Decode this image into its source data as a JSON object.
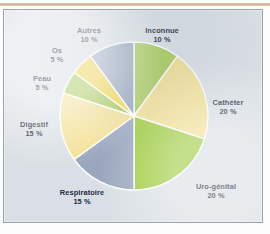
{
  "figure": {
    "background_color": "#d9dfe4",
    "frame_border_color": "#9aa3ab",
    "top_rule_color": "#efa898",
    "label_color": "#1d2a3d"
  },
  "chart_data": {
    "type": "pie",
    "title": "",
    "subtitle": "",
    "xlabel": "",
    "ylabel": "",
    "legend_position": "none",
    "grid": false,
    "start_angle_deg": 0,
    "direction": "clockwise",
    "unit": "%",
    "categories": [
      "Inconnue",
      "Cathéter",
      "Uro-génital",
      "Respiratoire",
      "Digestif",
      "Peau",
      "Os",
      "Autres"
    ],
    "values": [
      10,
      20,
      20,
      15,
      15,
      5,
      5,
      10
    ],
    "colors": [
      "#a8cc5c",
      "#f3e093",
      "#9ecb3e",
      "#9aa6be",
      "#f3e093",
      "#a3c952",
      "#f5d33f",
      "#93a2bd"
    ],
    "slices": [
      {
        "label": "Inconnue",
        "value_text": "10 %",
        "value": 10,
        "color": "#a8cc5c"
      },
      {
        "label": "Cathéter",
        "value_text": "20 %",
        "value": 20,
        "color": "#f3e093"
      },
      {
        "label": "Uro-génital",
        "value_text": "20 %",
        "value": 20,
        "color": "#9ecb3e"
      },
      {
        "label": "Respiratoire",
        "value_text": "15 %",
        "value": 15,
        "color": "#9aa6be"
      },
      {
        "label": "Digestif",
        "value_text": "15 %",
        "value": 15,
        "color": "#f3e093"
      },
      {
        "label": "Peau",
        "value_text": "5 %",
        "value": 5,
        "color": "#a3c952"
      },
      {
        "label": "Os",
        "value_text": "5 %",
        "value": 5,
        "color": "#f5d33f"
      },
      {
        "label": "Autres",
        "value_text": "10 %",
        "value": 10,
        "color": "#93a2bd"
      }
    ]
  }
}
